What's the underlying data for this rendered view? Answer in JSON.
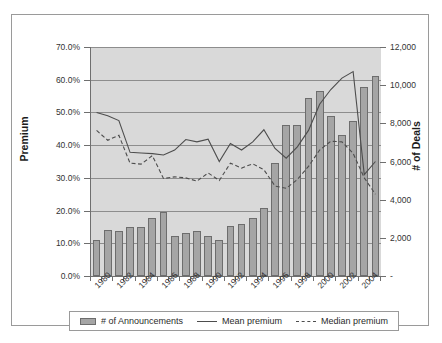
{
  "chart_data": {
    "type": "bar",
    "title": "",
    "xlabel": "",
    "ylabel": "Premium",
    "ylabel_right": "# of Deals",
    "grid": true,
    "legend_position": "bottom",
    "x": [
      1980,
      1981,
      1982,
      1983,
      1984,
      1985,
      1986,
      1987,
      1988,
      1989,
      1990,
      1991,
      1992,
      1993,
      1994,
      1995,
      1996,
      1997,
      1998,
      1999,
      2000,
      2001,
      2002,
      2003,
      2004,
      2005
    ],
    "categories": [
      "1980",
      "1981",
      "1982",
      "1983",
      "1984",
      "1985",
      "1986",
      "1987",
      "1988",
      "1989",
      "1990",
      "1991",
      "1992",
      "1993",
      "1994",
      "1995",
      "1996",
      "1997",
      "1998",
      "1999",
      "2000",
      "2001",
      "2002",
      "2003",
      "2004",
      "2005"
    ],
    "xtick_labels": [
      "1980",
      "1982",
      "1984",
      "1986",
      "1988",
      "1990",
      "1992",
      "1994",
      "1996",
      "1998",
      "2000",
      "2002",
      "2004"
    ],
    "ylim": [
      0,
      70
    ],
    "ytick_labels": [
      "0.0%",
      "10.0%",
      "20.0%",
      "30.0%",
      "40.0%",
      "50.0%",
      "60.0%",
      "70.0%"
    ],
    "ytick_values": [
      0,
      10,
      20,
      30,
      40,
      50,
      60,
      70
    ],
    "ylim_right": [
      0,
      12000
    ],
    "ytick_labels_right": [
      "-",
      "2,000",
      "4,000",
      "6,000",
      "8,000",
      "10,000",
      "12,000"
    ],
    "ytick_values_right": [
      0,
      2000,
      4000,
      6000,
      8000,
      10000,
      12000
    ],
    "series": [
      {
        "name": "# of Announcements",
        "type": "bar",
        "axis": "right",
        "color": "#a5a5a5",
        "values": [
          1900,
          2400,
          2350,
          2580,
          2580,
          3050,
          3350,
          2080,
          2250,
          2370,
          2100,
          1900,
          2610,
          2720,
          3050,
          3540,
          5900,
          7900,
          7900,
          9350,
          9700,
          8400,
          7400,
          8100,
          9900,
          10500
        ]
      },
      {
        "name": "Mean premium",
        "type": "line",
        "axis": "left",
        "style": "solid",
        "color": "#4d4d4d",
        "values": [
          50.0,
          49.0,
          47.5,
          37.8,
          37.6,
          37.4,
          37.0,
          38.5,
          41.7,
          41.0,
          41.8,
          35.0,
          40.5,
          38.5,
          41.0,
          44.7,
          39.0,
          36.0,
          39.5,
          44.5,
          52.5,
          57.0,
          60.5,
          62.5,
          31.0,
          35.0
        ]
      },
      {
        "name": "Median premium",
        "type": "line",
        "axis": "left",
        "style": "dashed",
        "color": "#4d4d4d",
        "values": [
          44.5,
          41.5,
          43.0,
          34.5,
          34.2,
          36.8,
          29.8,
          30.3,
          30.0,
          29.0,
          31.5,
          29.2,
          34.5,
          33.0,
          34.3,
          32.5,
          27.5,
          26.8,
          29.5,
          33.5,
          38.5,
          41.2,
          41.0,
          37.5,
          30.0,
          25.0
        ]
      }
    ]
  },
  "legend": {
    "items": [
      {
        "label": "# of Announcements",
        "marker": "bar-swatch"
      },
      {
        "label": "Mean premium",
        "marker": "solid-line"
      },
      {
        "label": "Median premium",
        "marker": "dashed-line"
      }
    ]
  },
  "axis_titles": {
    "left": "Premium",
    "right": "# of Deals"
  }
}
